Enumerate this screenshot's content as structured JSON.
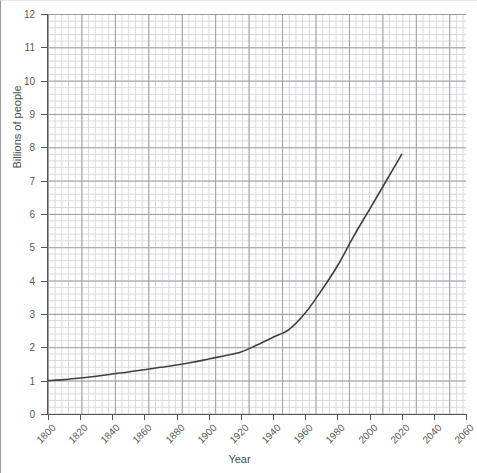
{
  "chart_data": {
    "type": "line",
    "title": "",
    "xlabel": "Year",
    "ylabel": "Billions of people",
    "xlim": [
      1800,
      2060
    ],
    "ylim": [
      0,
      12
    ],
    "grid": true,
    "grid_minor": true,
    "legend": "none",
    "line_color": "#404040",
    "x_ticks": [
      1800,
      1820,
      1840,
      1860,
      1880,
      1900,
      1920,
      1940,
      1960,
      1980,
      2000,
      2020,
      2040,
      2060
    ],
    "y_ticks": [
      0,
      1,
      2,
      3,
      4,
      5,
      6,
      7,
      8,
      9,
      10,
      11,
      12
    ],
    "series": [
      {
        "name": "World population",
        "x": [
          1800,
          1810,
          1820,
          1830,
          1840,
          1850,
          1860,
          1870,
          1880,
          1890,
          1900,
          1910,
          1920,
          1930,
          1940,
          1950,
          1960,
          1970,
          1980,
          1990,
          2000,
          2010,
          2020
        ],
        "values": [
          1.0,
          1.03,
          1.08,
          1.13,
          1.2,
          1.26,
          1.33,
          1.4,
          1.47,
          1.55,
          1.65,
          1.75,
          1.86,
          2.07,
          2.3,
          2.54,
          3.03,
          3.7,
          4.44,
          5.32,
          6.14,
          6.96,
          7.79
        ]
      }
    ]
  }
}
